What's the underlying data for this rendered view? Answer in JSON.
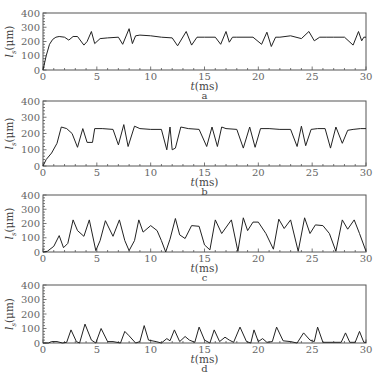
{
  "chart_data": [
    {
      "type": "line",
      "panel": "a",
      "xlabel": "t(ms)",
      "ylabel": "l_s(μm)",
      "xlim": [
        0,
        30
      ],
      "ylim": [
        0,
        400
      ],
      "xticks": [
        0,
        5,
        10,
        15,
        20,
        25,
        30
      ],
      "yticks": [
        0,
        100,
        200,
        300,
        400
      ],
      "grid": false,
      "x": [
        0,
        0.3,
        0.6,
        0.9,
        1.2,
        1.5,
        2.0,
        2.4,
        2.8,
        3.2,
        3.8,
        4.1,
        4.5,
        4.8,
        5.3,
        6.0,
        7.0,
        7.4,
        8.0,
        8.3,
        8.6,
        9.0,
        10.0,
        11.0,
        12.0,
        12.5,
        13.3,
        13.8,
        14.3,
        15.0,
        16.0,
        16.5,
        17.0,
        17.3,
        17.6,
        18.0,
        19.5,
        20.3,
        20.8,
        21.2,
        21.6,
        22.0,
        23.0,
        24.0,
        24.7,
        25.2,
        25.7,
        26.3,
        27.0,
        28.0,
        28.8,
        29.3,
        29.6,
        29.8,
        30.0
      ],
      "values": [
        0,
        100,
        180,
        215,
        230,
        235,
        230,
        210,
        235,
        235,
        175,
        200,
        270,
        185,
        220,
        225,
        230,
        180,
        290,
        185,
        240,
        245,
        240,
        230,
        225,
        170,
        270,
        175,
        230,
        230,
        230,
        180,
        270,
        195,
        230,
        230,
        230,
        180,
        265,
        165,
        230,
        230,
        240,
        220,
        270,
        205,
        230,
        230,
        230,
        230,
        175,
        270,
        205,
        230,
        230
      ]
    },
    {
      "type": "line",
      "panel": "b",
      "xlabel": "t(ms)",
      "ylabel": "l_s(μm)",
      "xlim": [
        0,
        30
      ],
      "ylim": [
        0,
        400
      ],
      "xticks": [
        0,
        5,
        10,
        15,
        20,
        25,
        30
      ],
      "yticks": [
        0,
        100,
        200,
        300,
        400
      ],
      "grid": false,
      "x": [
        0,
        0.3,
        0.8,
        1.3,
        1.7,
        2.2,
        2.7,
        3.2,
        3.7,
        4.1,
        4.6,
        4.8,
        5.5,
        6.5,
        7.0,
        7.5,
        7.9,
        8.5,
        9.0,
        10.0,
        11.0,
        11.5,
        11.8,
        12.0,
        12.3,
        12.8,
        13.5,
        14.5,
        15.2,
        15.7,
        16.2,
        16.6,
        17.0,
        18.0,
        18.6,
        19.2,
        19.7,
        20.2,
        21.0,
        22.0,
        23.0,
        23.6,
        24.0,
        24.4,
        24.9,
        25.5,
        26.2,
        26.7,
        27.2,
        27.8,
        28.3,
        28.8,
        29.5,
        30.0
      ],
      "values": [
        0,
        40,
        80,
        140,
        240,
        230,
        200,
        115,
        230,
        145,
        145,
        230,
        230,
        225,
        130,
        255,
        120,
        245,
        230,
        225,
        225,
        100,
        240,
        100,
        110,
        240,
        230,
        225,
        120,
        240,
        120,
        240,
        230,
        225,
        110,
        240,
        115,
        230,
        230,
        225,
        225,
        120,
        245,
        125,
        225,
        230,
        230,
        110,
        240,
        140,
        220,
        225,
        230,
        230
      ]
    },
    {
      "type": "line",
      "panel": "c",
      "xlabel": "t(ms)",
      "ylabel": "l_s(μm)",
      "xlim": [
        0,
        30
      ],
      "ylim": [
        0,
        400
      ],
      "xticks": [
        0,
        5,
        10,
        15,
        20,
        25,
        30
      ],
      "yticks": [
        0,
        100,
        200,
        300,
        400
      ],
      "grid": false,
      "x": [
        0,
        0.4,
        1.0,
        1.5,
        1.9,
        2.3,
        2.8,
        3.2,
        3.8,
        4.3,
        4.9,
        5.3,
        5.8,
        6.5,
        7.1,
        7.6,
        8.0,
        8.5,
        8.9,
        9.3,
        10.0,
        10.6,
        11.0,
        11.4,
        11.8,
        12.3,
        12.7,
        13.2,
        13.8,
        14.5,
        15.0,
        15.5,
        16.0,
        16.6,
        17.5,
        18.1,
        18.6,
        19.0,
        19.5,
        20.0,
        20.7,
        21.4,
        21.9,
        22.4,
        23.0,
        23.7,
        24.3,
        24.8,
        25.3,
        26.0,
        26.6,
        27.2,
        27.8,
        28.3,
        28.9,
        29.4,
        30.0
      ],
      "values": [
        0,
        5,
        40,
        115,
        30,
        60,
        225,
        150,
        110,
        225,
        10,
        80,
        220,
        110,
        225,
        80,
        10,
        80,
        225,
        140,
        185,
        150,
        80,
        0,
        90,
        235,
        120,
        95,
        185,
        180,
        50,
        15,
        225,
        130,
        225,
        5,
        240,
        150,
        210,
        210,
        130,
        20,
        230,
        165,
        225,
        5,
        240,
        130,
        190,
        185,
        130,
        5,
        225,
        160,
        225,
        130,
        5
      ]
    },
    {
      "type": "line",
      "panel": "d",
      "xlabel": "t(ms)",
      "ylabel": "l_s(μm)",
      "xlim": [
        0,
        30
      ],
      "ylim": [
        0,
        400
      ],
      "xticks": [
        0,
        5,
        10,
        15,
        20,
        25,
        30
      ],
      "yticks": [
        0,
        100,
        200,
        300,
        400
      ],
      "grid": false,
      "x": [
        0,
        0.5,
        0.8,
        1.3,
        1.8,
        2.2,
        2.6,
        3.1,
        3.4,
        3.9,
        4.5,
        4.9,
        5.4,
        6.0,
        6.5,
        7.2,
        7.6,
        8.0,
        8.6,
        9.0,
        9.4,
        9.8,
        10.5,
        11.0,
        11.5,
        11.8,
        12.2,
        12.7,
        13.2,
        13.6,
        14.1,
        14.5,
        15.0,
        15.5,
        15.9,
        16.4,
        16.9,
        17.3,
        17.7,
        18.3,
        18.9,
        19.3,
        19.6,
        20.0,
        20.4,
        20.8,
        21.3,
        21.7,
        22.3,
        23.0,
        23.6,
        24.2,
        24.8,
        25.2,
        25.5,
        26.0,
        27.0,
        27.7,
        28.1,
        28.5,
        29.0,
        29.4,
        29.8,
        30.0
      ],
      "values": [
        0,
        0,
        10,
        10,
        0,
        5,
        90,
        10,
        0,
        130,
        20,
        0,
        100,
        10,
        10,
        0,
        80,
        50,
        0,
        10,
        120,
        20,
        10,
        0,
        30,
        15,
        90,
        10,
        45,
        20,
        5,
        110,
        20,
        0,
        90,
        10,
        40,
        20,
        5,
        110,
        10,
        0,
        90,
        10,
        30,
        5,
        10,
        110,
        15,
        10,
        0,
        70,
        20,
        10,
        110,
        5,
        5,
        5,
        70,
        5,
        5,
        80,
        5,
        5
      ]
    }
  ],
  "panels": [
    {
      "label": "a",
      "xlabel": "t(ms)",
      "ylabel_main": "l",
      "ylabel_sub": "s",
      "ylabel_unit": "(μm)"
    },
    {
      "label": "b",
      "xlabel": "t(ms)",
      "ylabel_main": "l",
      "ylabel_sub": "s",
      "ylabel_unit": "(μm)"
    },
    {
      "label": "c",
      "xlabel": "t(ms)",
      "ylabel_main": "l",
      "ylabel_sub": "s",
      "ylabel_unit": "(μm)"
    },
    {
      "label": "d",
      "xlabel": "t(ms)",
      "ylabel_main": "l",
      "ylabel_sub": "s",
      "ylabel_unit": "(μm)"
    }
  ],
  "colors": {
    "line": "#222222",
    "frame": "#555555",
    "text": "#555555"
  }
}
